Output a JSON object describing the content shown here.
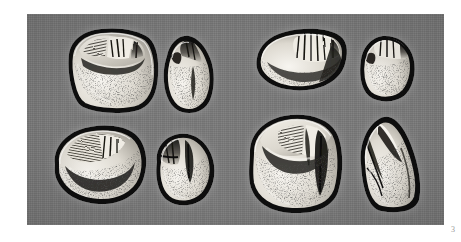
{
  "plate": {
    "figure_number": "3",
    "background_color": "#ffffff",
    "panel_color": "#7a7a7a",
    "panel_bounds": {
      "x": 27,
      "y": 14,
      "width": 417,
      "height": 211
    },
    "illustration_style": "stippled engraving halftone",
    "specimen_fill_light": "#e9e6df",
    "specimen_fill_shadow": "#4a4845",
    "specimen_outline": "#151515"
  },
  "specimens": [
    {
      "id": "a1",
      "label": "upper-left-occlusal",
      "view": "occlusal",
      "position": {
        "x": 26,
        "y": 10,
        "width": 112,
        "height": 92
      }
    },
    {
      "id": "a2",
      "label": "upper-left-lateral",
      "view": "lateral",
      "position": {
        "x": 126,
        "y": 16,
        "width": 70,
        "height": 88
      }
    },
    {
      "id": "b1",
      "label": "lower-left-occlusal",
      "view": "occlusal",
      "position": {
        "x": 14,
        "y": 104,
        "width": 116,
        "height": 92
      }
    },
    {
      "id": "b2",
      "label": "lower-left-lateral",
      "view": "lateral",
      "position": {
        "x": 118,
        "y": 112,
        "width": 76,
        "height": 86
      }
    },
    {
      "id": "c1",
      "label": "upper-right-occlusal",
      "view": "occlusal",
      "position": {
        "x": 220,
        "y": 8,
        "width": 106,
        "height": 76
      }
    },
    {
      "id": "c2",
      "label": "upper-right-lateral",
      "view": "lateral",
      "position": {
        "x": 322,
        "y": 14,
        "width": 72,
        "height": 78
      }
    },
    {
      "id": "d1",
      "label": "lower-right-occlusal",
      "view": "occlusal",
      "position": {
        "x": 213,
        "y": 94,
        "width": 110,
        "height": 112
      }
    },
    {
      "id": "d2",
      "label": "lower-right-lateral",
      "view": "lateral",
      "position": {
        "x": 318,
        "y": 94,
        "width": 90,
        "height": 110
      }
    }
  ]
}
